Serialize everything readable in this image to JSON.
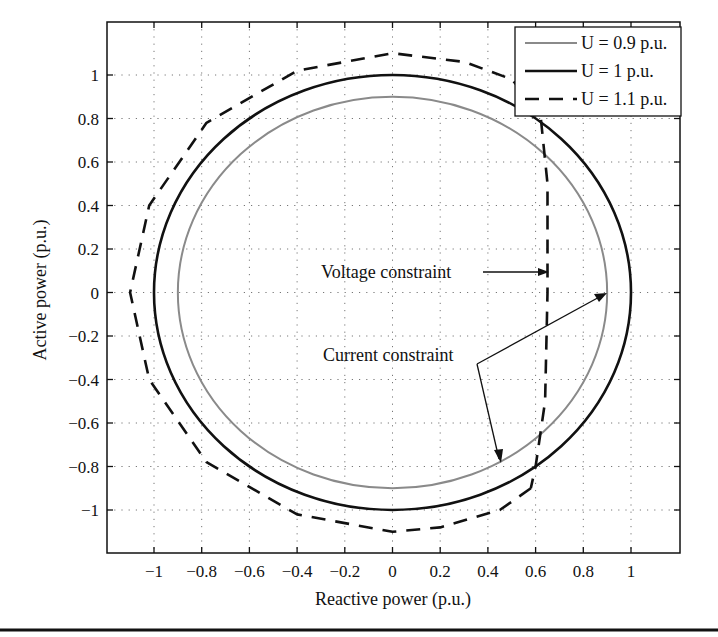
{
  "chart_data": {
    "type": "line",
    "title": "",
    "xlabel": "Reactive power (p.u.)",
    "ylabel": "Active power (p.u.)",
    "xlim": [
      -1.2,
      1.2
    ],
    "ylim": [
      -1.2,
      1.2
    ],
    "grid": true,
    "legend_position": "upper right",
    "x_ticks": [
      -1,
      -0.8,
      -0.6,
      -0.4,
      -0.2,
      0,
      0.2,
      0.4,
      0.6,
      0.8,
      1
    ],
    "x_tick_labels": [
      "−1",
      "−0.8",
      "−0.6",
      "−0.4",
      "−0.2",
      "0",
      "0.2",
      "0.4",
      "0.6",
      "0.8",
      "1"
    ],
    "y_ticks": [
      1,
      0.8,
      0.6,
      0.4,
      0.2,
      0,
      -0.2,
      -0.4,
      -0.6,
      -0.8,
      -1
    ],
    "y_tick_labels": [
      "1",
      "0.8",
      "0.6",
      "0.4",
      "0.2",
      "0",
      "−0.2",
      "−0.4",
      "−0.6",
      "−0.8",
      "−1"
    ],
    "series": [
      {
        "name": "U = 0.9 p.u.",
        "style": "solid",
        "color": "#8a8a8a",
        "shape": "circle",
        "radius": 0.9,
        "center": [
          0,
          0
        ]
      },
      {
        "name": "U = 1 p.u.",
        "style": "solid",
        "color": "#111111",
        "shape": "circle",
        "radius": 1.0,
        "center": [
          0,
          0
        ]
      },
      {
        "name": "U = 1.1 p.u.",
        "style": "dashed",
        "color": "#111111",
        "shape": "circle clipped by vertical line",
        "radius": 1.1,
        "center": [
          0,
          0
        ],
        "clip_x": 0.65,
        "points": [
          [
            0.58,
            -0.9
          ],
          [
            0.45,
            -1.0
          ],
          [
            0.2,
            -1.08
          ],
          [
            0,
            -1.1
          ],
          [
            -0.4,
            -1.02
          ],
          [
            -0.78,
            -0.78
          ],
          [
            -1.02,
            -0.4
          ],
          [
            -1.1,
            0
          ],
          [
            -1.02,
            0.4
          ],
          [
            -0.78,
            0.78
          ],
          [
            -0.4,
            1.02
          ],
          [
            0,
            1.1
          ],
          [
            0.3,
            1.06
          ],
          [
            0.5,
            0.98
          ],
          [
            0.62,
            0.82
          ],
          [
            0.65,
            0.5
          ],
          [
            0.65,
            0
          ],
          [
            0.64,
            -0.5
          ],
          [
            0.6,
            -0.8
          ],
          [
            0.58,
            -0.9
          ]
        ]
      }
    ],
    "annotations": [
      {
        "text": "Voltage constraint",
        "arrow_to": [
          0.65,
          0.1
        ]
      },
      {
        "text": "Current constraint",
        "arrow_to": [
          [
            0.9,
            0.0
          ],
          [
            0.45,
            -0.77
          ]
        ]
      }
    ]
  },
  "labels": {
    "voltage_constraint": "Voltage constraint",
    "current_constraint": "Current constraint",
    "xlabel": "Reactive power (p.u.)",
    "ylabel": "Active power (p.u.)",
    "legend": [
      "U = 0.9 p.u.",
      "U = 1 p.u.",
      "U = 1.1 p.u."
    ]
  }
}
